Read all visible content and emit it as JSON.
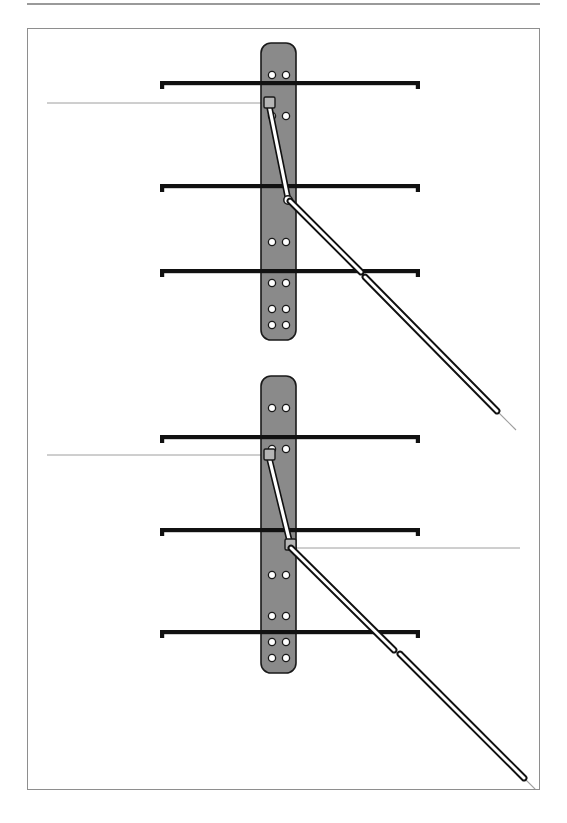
{
  "page": {
    "width": 567,
    "height": 823,
    "background": "#ffffff",
    "top_rule_color": "#9a9a9a",
    "frame_border_color": "#8e8e8e"
  },
  "caption": {
    "text": ""
  },
  "figure": {
    "title": "",
    "frame": {
      "x": 27,
      "y": 28,
      "width": 513,
      "height": 762
    },
    "colors": {
      "plate_fill": "#8a8a8a",
      "plate_stroke": "#1a1a1a",
      "hole_fill": "#ffffff",
      "hole_stroke": "#1a1a1a",
      "bar_fill": "#111111",
      "rod_fill": "#ffffff",
      "rod_stroke": "#111111",
      "thin_line": "#9e9e9e",
      "block_fill": "#b5b5b5"
    },
    "panels": [
      {
        "name": "upper-assembly",
        "plate": {
          "x": 233,
          "y": 14,
          "width": 35,
          "height": 297,
          "corner_radius": 10,
          "hole_pairs_y": [
            32,
            73,
            199,
            240,
            266,
            282
          ],
          "hole_columns_x": [
            11,
            25
          ],
          "hole_radius": 3.6
        },
        "bars": [
          {
            "label": "bar-top",
            "y": 52,
            "x_start": 132,
            "x_end": 392,
            "thickness": 4.2,
            "hook_height": 8
          },
          {
            "label": "bar-middle",
            "y": 155,
            "x_start": 132,
            "x_end": 392,
            "thickness": 4.2,
            "hook_height": 8
          },
          {
            "label": "bar-bottom",
            "y": 240,
            "x_start": 132,
            "x_end": 392,
            "thickness": 4.2,
            "hook_height": 8
          }
        ],
        "thin_guide_line": {
          "y": 74,
          "x_start": 19,
          "x_end": 243
        },
        "connector": {
          "upper_block": {
            "x": 236,
            "y": 68,
            "width": 11,
            "height": 11
          },
          "link": {
            "x1": 241,
            "y1": 76,
            "x2": 260,
            "y2": 170,
            "width": 4.6
          },
          "lower_pivot": {
            "cx": 260,
            "cy": 171,
            "r": 4.2
          }
        },
        "rods": [
          {
            "label": "rod-upper",
            "x1": 262,
            "y1": 172,
            "x2": 333,
            "y2": 243,
            "width": 5.2
          },
          {
            "label": "rod-lower",
            "x1": 337,
            "y1": 248,
            "x2": 469,
            "y2": 382,
            "width": 5.2
          }
        ],
        "tail_lines": [
          {
            "x1": 331,
            "y1": 241,
            "x2": 345,
            "y2": 255
          },
          {
            "x1": 467,
            "y1": 380,
            "x2": 488,
            "y2": 401
          }
        ]
      },
      {
        "name": "lower-assembly",
        "plate": {
          "x": 233,
          "y": 347,
          "width": 35,
          "height": 297,
          "corner_radius": 10,
          "hole_pairs_y": [
            32,
            73,
            199,
            240,
            266,
            282
          ],
          "hole_columns_x": [
            11,
            25
          ],
          "hole_radius": 3.6
        },
        "bars": [
          {
            "label": "bar-top",
            "y": 406,
            "x_start": 132,
            "x_end": 392,
            "thickness": 4.2,
            "hook_height": 8
          },
          {
            "label": "bar-middle",
            "y": 499,
            "x_start": 132,
            "x_end": 392,
            "thickness": 4.2,
            "hook_height": 8
          },
          {
            "label": "bar-bottom",
            "y": 601,
            "x_start": 132,
            "x_end": 392,
            "thickness": 4.2,
            "hook_height": 8
          }
        ],
        "thin_guide_line": {
          "y": 426,
          "x_start": 19,
          "x_end": 243
        },
        "thin_guide_line_2": {
          "y": 519,
          "x_start": 262,
          "x_end": 492
        },
        "connector": {
          "upper_block": {
            "x": 236,
            "y": 420,
            "width": 11,
            "height": 11
          },
          "link": {
            "x1": 241,
            "y1": 428,
            "x2": 262,
            "y2": 514,
            "width": 4.6
          },
          "lower_block": {
            "x": 257,
            "y": 510,
            "width": 11,
            "height": 11
          }
        },
        "rods": [
          {
            "label": "rod-upper",
            "x1": 263,
            "y1": 519,
            "x2": 366,
            "y2": 621,
            "width": 5.2
          },
          {
            "label": "rod-lower",
            "x1": 372,
            "y1": 625,
            "x2": 496,
            "y2": 749,
            "width": 5.2
          }
        ],
        "tail_lines": [
          {
            "x1": 364,
            "y1": 619,
            "x2": 378,
            "y2": 633
          },
          {
            "x1": 494,
            "y1": 747,
            "x2": 516,
            "y2": 769
          }
        ]
      }
    ]
  }
}
